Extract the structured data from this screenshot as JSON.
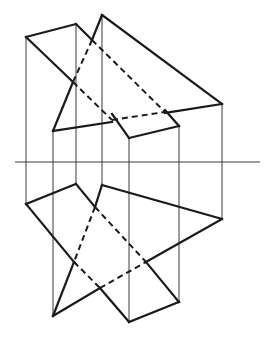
{
  "figure": {
    "colors": {
      "line": "#1a1a1a",
      "projection_line": "#3a3a3a",
      "background": "#ffffff"
    },
    "axis": {
      "x1": 15,
      "x2": 260,
      "y": 162
    },
    "projection_lines_x": [
      26,
      53,
      76,
      102,
      129,
      179,
      222
    ],
    "upper_view": {
      "quadrilateral": [
        [
          26,
          37
        ],
        [
          76,
          24
        ],
        [
          179,
          126
        ],
        [
          129,
          138
        ]
      ],
      "triangle": [
        [
          102,
          15
        ],
        [
          222,
          104
        ],
        [
          53,
          131
        ]
      ],
      "visible_segments": [
        [
          [
            26,
            37
          ],
          [
            76,
            24
          ]
        ],
        [
          [
            76,
            24
          ],
          [
            92,
            40
          ]
        ],
        [
          [
            26,
            37
          ],
          [
            73,
            82
          ]
        ],
        [
          [
            112,
            114
          ],
          [
            129,
            138
          ]
        ],
        [
          [
            129,
            138
          ],
          [
            179,
            126
          ]
        ],
        [
          [
            179,
            126
          ],
          [
            165,
            110
          ]
        ],
        [
          [
            102,
            15
          ],
          [
            92,
            40
          ]
        ],
        [
          [
            102,
            15
          ],
          [
            222,
            104
          ]
        ],
        [
          [
            222,
            104
          ],
          [
            165,
            113
          ]
        ],
        [
          [
            112,
            122
          ],
          [
            53,
            131
          ]
        ],
        [
          [
            53,
            131
          ],
          [
            73,
            82
          ]
        ]
      ],
      "hidden_segments": [
        [
          [
            92,
            40
          ],
          [
            165,
            112
          ]
        ],
        [
          [
            73,
            82
          ],
          [
            112,
            120
          ]
        ],
        [
          [
            92,
            40
          ],
          [
            73,
            82
          ]
        ],
        [
          [
            112,
            120
          ],
          [
            165,
            112
          ]
        ]
      ]
    },
    "lower_view": {
      "quadrilateral": [
        [
          26,
          204
        ],
        [
          76,
          184
        ],
        [
          179,
          302
        ],
        [
          129,
          322
        ]
      ],
      "triangle": [
        [
          102,
          185
        ],
        [
          222,
          219
        ],
        [
          53,
          316
        ]
      ],
      "visible_segments": [
        [
          [
            26,
            204
          ],
          [
            76,
            184
          ]
        ],
        [
          [
            76,
            184
          ],
          [
            95,
            207
          ]
        ],
        [
          [
            26,
            204
          ],
          [
            74,
            262
          ]
        ],
        [
          [
            100,
            288
          ],
          [
            129,
            322
          ]
        ],
        [
          [
            129,
            322
          ],
          [
            179,
            302
          ]
        ],
        [
          [
            179,
            302
          ],
          [
            146,
            262
          ]
        ],
        [
          [
            102,
            185
          ],
          [
            95,
            207
          ]
        ],
        [
          [
            102,
            185
          ],
          [
            222,
            219
          ]
        ],
        [
          [
            222,
            219
          ],
          [
            146,
            262
          ]
        ],
        [
          [
            100,
            288
          ],
          [
            53,
            316
          ]
        ],
        [
          [
            53,
            316
          ],
          [
            74,
            262
          ]
        ]
      ],
      "hidden_segments": [
        [
          [
            95,
            207
          ],
          [
            146,
            262
          ]
        ],
        [
          [
            74,
            262
          ],
          [
            100,
            288
          ]
        ],
        [
          [
            95,
            207
          ],
          [
            74,
            262
          ]
        ],
        [
          [
            100,
            288
          ],
          [
            146,
            262
          ]
        ]
      ]
    },
    "projection_line_spans": [
      {
        "x": 26,
        "y1": 37,
        "y2": 204
      },
      {
        "x": 53,
        "y1": 131,
        "y2": 316
      },
      {
        "x": 76,
        "y1": 24,
        "y2": 184
      },
      {
        "x": 102,
        "y1": 15,
        "y2": 185
      },
      {
        "x": 129,
        "y1": 138,
        "y2": 322
      },
      {
        "x": 179,
        "y1": 126,
        "y2": 302
      },
      {
        "x": 222,
        "y1": 104,
        "y2": 219
      }
    ]
  },
  "caption": "Intersection of two planes – two-view projection"
}
